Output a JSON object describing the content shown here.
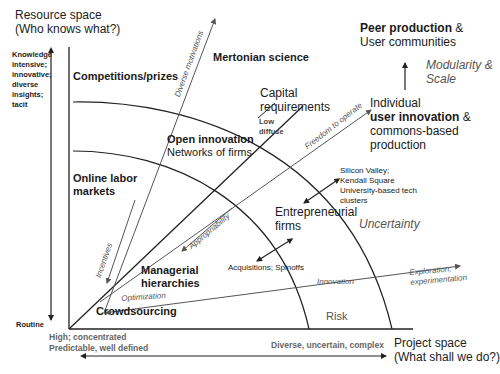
{
  "axes": {
    "y_title_line1": "Resource space",
    "y_title_line2": "(Who knows what?)",
    "y_top_label": [
      "Knowledge",
      "intensive;",
      "innovative;",
      "diverse",
      "insights;",
      "tacit"
    ],
    "y_bottom_label": "Routine",
    "x_title_line1": "Project space",
    "x_title_line2": "(What shall we do?)",
    "x_left_label_line1": "High; concentrated",
    "x_left_label_line2": "Predictable, well defined",
    "x_right_label": "Diverse, uncertain, complex"
  },
  "regions": {
    "competitions": "Competitions/prizes",
    "mertonian": "Mertonian science",
    "online_labor_line1": "Online labor",
    "online_labor_line2": "markets",
    "open_innovation": "Open innovation",
    "networks": "Networks of firms",
    "managerial_line1": "Managerial",
    "managerial_line2": "hierarchies",
    "crowdsourcing": "Crowdsourcing",
    "entrepreneurial_line1": "Entrepreneurial",
    "entrepreneurial_line2": "firms",
    "peer_bold": "Peer production",
    "peer_rest": " &",
    "user_communities": "User communities",
    "individual": "Individual",
    "user_innovation_bold": "user innovation",
    "user_innovation_rest": " &",
    "commons": "commons-based",
    "production": "production"
  },
  "annotations": {
    "capital_line1": "Capital",
    "capital_line2": "requirements",
    "low": "Low",
    "diffuse": "diffuse",
    "modularity_line1": "Modularity &",
    "modularity_line2": "Scale",
    "silicon_line1": "Silicon Valley;",
    "silicon_line2": "Kendall Square",
    "silicon_line3": "University-based tech",
    "silicon_line4": "clusters",
    "acquisitions": "Acquisitions; Spinoffs",
    "uncertainty": "Uncertainty",
    "risk": "Risk",
    "innovation": "Innovation",
    "exploration_line1": "Exploration;",
    "exploration_line2": "experimentation",
    "optimization": "Optimization",
    "incentives": "Incentives",
    "appropriability": "Appropriability",
    "freedom": "Freedom to operate",
    "diverse_motivations": "Diverse motivations"
  },
  "colors": {
    "line": "#222222",
    "grey_line": "#555555",
    "italic_text": "#555555"
  }
}
